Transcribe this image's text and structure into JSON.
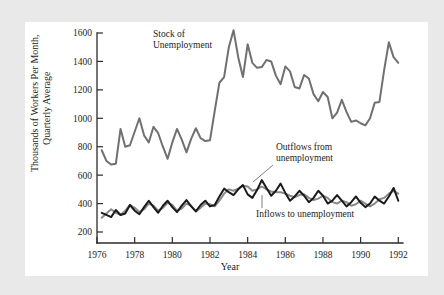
{
  "figure": {
    "background_color": "#e9e9e9",
    "card_color": "#ffffff",
    "axis_color": "#2b2b2b"
  },
  "annotations": {
    "stock_label_line1": "Stock of",
    "stock_label_line2": "Unemployment",
    "outflow_label_line1": "Outflows from",
    "outflow_label_line2": "unemployment",
    "inflow_label": "Inflows to unemployment"
  },
  "axes": {
    "ylabel_line1": "Thousands of Workers Per Month,",
    "ylabel_line2": "Quarterly Average",
    "xlabel": "Year",
    "yticks": [
      "200",
      "400",
      "600",
      "800",
      "1000",
      "1200",
      "1400",
      "1600"
    ],
    "xticks": [
      "1976",
      "1978",
      "1980",
      "1982",
      "1984",
      "1986",
      "1988",
      "1990",
      "1992"
    ]
  },
  "chart_data": {
    "type": "line",
    "title": "",
    "xlabel": "Year",
    "ylabel": "Thousands of Workers Per Month, Quarterly Average",
    "xlim": [
      1976.0,
      1992.25
    ],
    "ylim": [
      200,
      1680
    ],
    "ytick_values": [
      200,
      400,
      600,
      800,
      1000,
      1200,
      1400,
      1600
    ],
    "xtick_values": [
      1976,
      1978,
      1980,
      1982,
      1984,
      1986,
      1988,
      1990,
      1992
    ],
    "grid": false,
    "legend": "annotated-inline",
    "colors": {
      "stock": "#707070",
      "outflows": "#8a8a8a",
      "inflows": "#1a1a1a"
    },
    "series": [
      {
        "name": "Stock of Unemployment",
        "color": "#707070",
        "x": [
          1976.25,
          1976.5,
          1976.75,
          1977.0,
          1977.25,
          1977.5,
          1977.75,
          1978.0,
          1978.25,
          1978.5,
          1978.75,
          1979.0,
          1979.25,
          1979.5,
          1979.75,
          1980.0,
          1980.25,
          1980.5,
          1980.75,
          1981.0,
          1981.25,
          1981.5,
          1981.75,
          1982.0,
          1982.25,
          1982.5,
          1982.75,
          1983.0,
          1983.25,
          1983.5,
          1983.75,
          1984.0,
          1984.25,
          1984.5,
          1984.75,
          1985.0,
          1985.25,
          1985.5,
          1985.75,
          1986.0,
          1986.25,
          1986.5,
          1986.75,
          1987.0,
          1987.25,
          1987.5,
          1987.75,
          1988.0,
          1988.25,
          1988.5,
          1988.75,
          1989.0,
          1989.25,
          1989.5,
          1989.75,
          1990.0,
          1990.25,
          1990.5,
          1990.75,
          1991.0,
          1991.25,
          1991.5,
          1991.75,
          1992.0
        ],
        "values": [
          775,
          700,
          675,
          680,
          925,
          800,
          810,
          905,
          1000,
          880,
          830,
          940,
          895,
          800,
          715,
          830,
          925,
          850,
          760,
          855,
          930,
          860,
          840,
          845,
          1050,
          1250,
          1290,
          1500,
          1620,
          1430,
          1290,
          1520,
          1390,
          1355,
          1360,
          1410,
          1400,
          1300,
          1240,
          1365,
          1330,
          1220,
          1210,
          1305,
          1280,
          1170,
          1120,
          1185,
          1150,
          1000,
          1040,
          1130,
          1045,
          975,
          985,
          965,
          950,
          1000,
          1110,
          1115,
          1340,
          1535,
          1430,
          1390
        ]
      },
      {
        "name": "Outflows from unemployment",
        "color": "#8a8a8a",
        "x": [
          1976.25,
          1976.5,
          1976.75,
          1977.0,
          1977.25,
          1977.5,
          1977.75,
          1978.0,
          1978.25,
          1978.5,
          1978.75,
          1979.0,
          1979.25,
          1979.5,
          1979.75,
          1980.0,
          1980.25,
          1980.5,
          1980.75,
          1981.0,
          1981.25,
          1981.5,
          1981.75,
          1982.0,
          1982.25,
          1982.5,
          1982.75,
          1983.0,
          1983.25,
          1983.5,
          1983.75,
          1984.0,
          1984.25,
          1984.5,
          1984.75,
          1985.0,
          1985.25,
          1985.5,
          1985.75,
          1986.0,
          1986.25,
          1986.5,
          1986.75,
          1987.0,
          1987.25,
          1987.5,
          1987.75,
          1988.0,
          1988.25,
          1988.5,
          1988.75,
          1989.0,
          1989.25,
          1989.5,
          1989.75,
          1990.0,
          1990.25,
          1990.5,
          1990.75,
          1991.0,
          1991.25,
          1991.5,
          1991.75,
          1992.0
        ],
        "values": [
          300,
          330,
          360,
          335,
          320,
          350,
          390,
          370,
          340,
          360,
          400,
          385,
          350,
          370,
          405,
          390,
          350,
          365,
          400,
          385,
          345,
          370,
          400,
          395,
          380,
          420,
          470,
          500,
          490,
          505,
          525,
          520,
          490,
          500,
          520,
          500,
          485,
          480,
          480,
          470,
          455,
          445,
          460,
          465,
          440,
          425,
          435,
          455,
          440,
          410,
          400,
          420,
          410,
          385,
          395,
          420,
          400,
          380,
          400,
          430,
          440,
          470,
          490,
          470
        ]
      },
      {
        "name": "Inflows to unemployment",
        "color": "#1a1a1a",
        "x": [
          1976.25,
          1976.5,
          1976.75,
          1977.0,
          1977.25,
          1977.5,
          1977.75,
          1978.0,
          1978.25,
          1978.5,
          1978.75,
          1979.0,
          1979.25,
          1979.5,
          1979.75,
          1980.0,
          1980.25,
          1980.5,
          1980.75,
          1981.0,
          1981.25,
          1981.5,
          1981.75,
          1982.0,
          1982.25,
          1982.5,
          1982.75,
          1983.0,
          1983.25,
          1983.5,
          1983.75,
          1984.0,
          1984.25,
          1984.5,
          1984.75,
          1985.0,
          1985.25,
          1985.5,
          1985.75,
          1986.0,
          1986.25,
          1986.5,
          1986.75,
          1987.0,
          1987.25,
          1987.5,
          1987.75,
          1988.0,
          1988.25,
          1988.5,
          1988.75,
          1989.0,
          1989.25,
          1989.5,
          1989.75,
          1990.0,
          1990.25,
          1990.5,
          1990.75,
          1991.0,
          1991.25,
          1991.5,
          1991.75,
          1992.0
        ],
        "values": [
          335,
          320,
          305,
          355,
          320,
          330,
          390,
          350,
          325,
          375,
          420,
          375,
          335,
          385,
          420,
          375,
          340,
          385,
          425,
          380,
          345,
          390,
          420,
          380,
          390,
          450,
          505,
          480,
          460,
          500,
          530,
          465,
          440,
          495,
          565,
          510,
          455,
          490,
          540,
          475,
          420,
          450,
          490,
          455,
          410,
          440,
          490,
          455,
          400,
          420,
          460,
          420,
          380,
          410,
          450,
          405,
          375,
          400,
          450,
          420,
          400,
          450,
          510,
          420
        ]
      }
    ]
  }
}
